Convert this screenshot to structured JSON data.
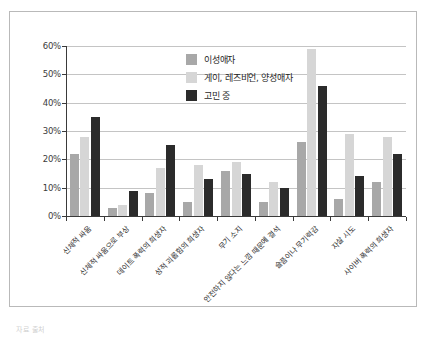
{
  "chart_data": {
    "type": "bar",
    "title": "",
    "xlabel": "",
    "ylabel": "",
    "ylim": [
      0,
      60
    ],
    "ytick_values": [
      0,
      10,
      20,
      30,
      40,
      50,
      60
    ],
    "ytick_labels": [
      "0%",
      "10%",
      "20%",
      "30%",
      "40%",
      "50%",
      "60%"
    ],
    "grid": true,
    "legend_position": "upper-center",
    "categories": [
      "신체적 싸움",
      "신체적 싸움으로 부상",
      "데이트 폭력의 희생자",
      "성적 괴롭힘의 희생자",
      "무기 소지",
      "안전하지 않다는 느낌 때문에 결석",
      "슬픔이나 무기력감",
      "자살 시도",
      "사이버 폭력의 희생자"
    ],
    "series": [
      {
        "name": "이성애자",
        "color": "#a8a8a8",
        "values": [
          22,
          3,
          8,
          5,
          16,
          5,
          26,
          6,
          12
        ]
      },
      {
        "name": "게이, 레즈비언, 양성애자",
        "color": "#d6d6d6",
        "values": [
          28,
          4,
          17,
          18,
          19,
          12,
          59,
          29,
          28
        ]
      },
      {
        "name": "고민 중",
        "color": "#2b2b2b",
        "values": [
          35,
          9,
          25,
          13,
          15,
          10,
          46,
          14,
          22
        ]
      }
    ]
  },
  "legend": {
    "items": [
      {
        "label": "이성애자",
        "swatch": "s0"
      },
      {
        "label": "게이, 레즈비언, 양성애자",
        "swatch": "s1"
      },
      {
        "label": "고민 중",
        "swatch": "s2"
      }
    ]
  },
  "caption": {
    "text": "자료 출처"
  }
}
